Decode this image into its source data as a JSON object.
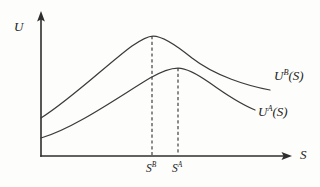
{
  "figure": {
    "background_color": "#fdfdfb",
    "line_color": "#3b3b3b",
    "axis_color": "#2e2e2e",
    "axis": {
      "y_label": "U",
      "x_label": "S",
      "origin_x": 41,
      "origin_y": 156,
      "y_top": 12,
      "x_right": 292
    },
    "labels": {
      "curve_b_base": "U",
      "curve_b_sup": "B",
      "curve_b_arg": "(S)",
      "curve_a_base": "U",
      "curve_a_sup": "A",
      "curve_a_arg": "(S)",
      "tick_b_base": "S",
      "tick_b_sup": "B",
      "tick_a_base": "S",
      "tick_a_sup": "A"
    }
  },
  "chart_data": {
    "type": "line",
    "title": "",
    "xlabel": "S",
    "ylabel": "U",
    "grid": false,
    "legend": "inline-right-of-curve",
    "annotations": [
      {
        "name": "dashed-drop-sb",
        "x": 152,
        "from_y": 36,
        "to_y": 156,
        "style": "dashed-vertical"
      },
      {
        "name": "dashed-drop-sa",
        "x": 178,
        "from_y": 68,
        "to_y": 156,
        "style": "dashed-vertical"
      }
    ],
    "tick_labels": {
      "x": [
        "S^B",
        "S^A"
      ],
      "y": []
    },
    "series": [
      {
        "name": "U^B(S)",
        "label": "U B (S)",
        "path": "M 41 118 C 70 100, 110 62, 132 46 C 142 39, 148 36, 153 36 C 162 36, 175 44, 192 58 C 215 76, 248 86, 270 90",
        "start_point": [
          41,
          118
        ],
        "peak_point": [
          153,
          36
        ],
        "end_point": [
          270,
          90
        ],
        "points": [
          [
            41,
            118
          ],
          [
            70,
            100
          ],
          [
            100,
            74
          ],
          [
            125,
            52
          ],
          [
            153,
            36
          ],
          [
            180,
            48
          ],
          [
            210,
            68
          ],
          [
            240,
            82
          ],
          [
            270,
            90
          ]
        ]
      },
      {
        "name": "U^A(S)",
        "label": "U A (S)",
        "path": "M 41 138 C 75 128, 120 96, 150 78 C 162 71, 171 68, 178 68 C 186 68, 196 73, 210 83 C 228 96, 243 105, 255 110",
        "start_point": [
          41,
          138
        ],
        "peak_point": [
          178,
          68
        ],
        "end_point": [
          255,
          110
        ],
        "points": [
          [
            41,
            138
          ],
          [
            75,
            124
          ],
          [
            110,
            100
          ],
          [
            145,
            80
          ],
          [
            178,
            68
          ],
          [
            205,
            80
          ],
          [
            228,
            95
          ],
          [
            242,
            103
          ],
          [
            255,
            110
          ]
        ]
      }
    ],
    "x_markers": [
      {
        "label": "S^B",
        "x": 152,
        "belongs_to": "U^B(S)"
      },
      {
        "label": "S^A",
        "x": 178,
        "belongs_to": "U^A(S)"
      }
    ],
    "xlim": [
      41,
      292
    ],
    "ylim_pixels": [
      156,
      12
    ]
  }
}
